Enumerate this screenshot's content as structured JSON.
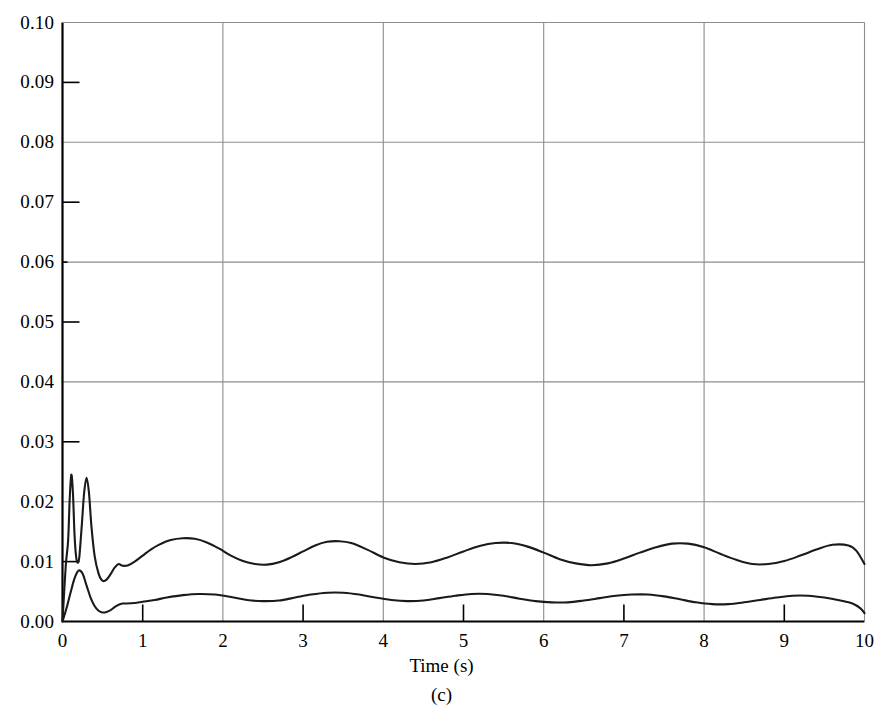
{
  "chart_data": {
    "type": "line",
    "title": "",
    "subfigure_label": "(c)",
    "xlabel": "Time (s)",
    "ylabel": "",
    "xlim": [
      0,
      10
    ],
    "ylim": [
      0,
      0.1
    ],
    "grid": true,
    "grid_x_values": [
      2,
      4,
      6,
      8
    ],
    "grid_y_values": [
      0.02,
      0.04,
      0.06,
      0.08,
      0.1
    ],
    "tick_only_x_values": [
      1,
      3,
      5,
      7,
      9
    ],
    "tick_only_y_values": [
      0.01,
      0.03,
      0.05,
      0.07,
      0.09
    ],
    "xticks": [
      0,
      1,
      2,
      3,
      4,
      5,
      6,
      7,
      8,
      9,
      10
    ],
    "xticklabels": [
      "0",
      "1",
      "2",
      "3",
      "4",
      "5",
      "6",
      "7",
      "8",
      "9",
      "10"
    ],
    "yticks": [
      0.0,
      0.01,
      0.02,
      0.03,
      0.04,
      0.05,
      0.06,
      0.07,
      0.08,
      0.09,
      0.1
    ],
    "yticklabels": [
      "0.00",
      "0.01",
      "0.02",
      "0.03",
      "0.04",
      "0.05",
      "0.06",
      "0.07",
      "0.08",
      "0.09",
      "0.10"
    ],
    "legend": null,
    "line_color": "#1a1a1a",
    "grid_color": "#8c8c8c",
    "axis_color": "#000000",
    "series": [
      {
        "name": "upper-curve",
        "x": [
          0.0,
          0.04,
          0.07,
          0.09,
          0.11,
          0.13,
          0.15,
          0.17,
          0.19,
          0.21,
          0.24,
          0.27,
          0.3,
          0.33,
          0.36,
          0.4,
          0.45,
          0.5,
          0.55,
          0.6,
          0.65,
          0.7,
          0.75,
          0.82,
          0.9,
          1.0,
          1.1,
          1.2,
          1.35,
          1.5,
          1.65,
          1.8,
          1.95,
          2.1,
          2.25,
          2.4,
          2.55,
          2.7,
          2.85,
          3.0,
          3.15,
          3.3,
          3.45,
          3.6,
          3.8,
          4.0,
          4.2,
          4.4,
          4.6,
          4.8,
          5.0,
          5.2,
          5.4,
          5.6,
          5.8,
          6.0,
          6.2,
          6.4,
          6.6,
          6.8,
          7.0,
          7.2,
          7.4,
          7.6,
          7.8,
          8.0,
          8.2,
          8.4,
          8.6,
          8.8,
          9.0,
          9.2,
          9.4,
          9.6,
          9.8,
          9.9,
          10.0
        ],
        "y": [
          0.0,
          0.0092,
          0.0135,
          0.0205,
          0.0245,
          0.0215,
          0.0145,
          0.0108,
          0.0098,
          0.0108,
          0.016,
          0.0215,
          0.024,
          0.0215,
          0.016,
          0.011,
          0.008,
          0.0068,
          0.007,
          0.0079,
          0.009,
          0.0096,
          0.0093,
          0.0094,
          0.01,
          0.011,
          0.012,
          0.0128,
          0.0136,
          0.0139,
          0.0138,
          0.0132,
          0.0122,
          0.011,
          0.0101,
          0.0096,
          0.0095,
          0.0099,
          0.0107,
          0.0117,
          0.0127,
          0.0133,
          0.0134,
          0.0131,
          0.012,
          0.0107,
          0.0099,
          0.0096,
          0.0099,
          0.0107,
          0.0117,
          0.0126,
          0.0131,
          0.0131,
          0.0125,
          0.0115,
          0.0104,
          0.0097,
          0.0094,
          0.0097,
          0.0105,
          0.0115,
          0.0124,
          0.013,
          0.013,
          0.0124,
          0.0113,
          0.0103,
          0.0096,
          0.0096,
          0.0101,
          0.011,
          0.012,
          0.0128,
          0.0127,
          0.0118,
          0.0096
        ]
      },
      {
        "name": "lower-curve",
        "x": [
          0.0,
          0.05,
          0.1,
          0.15,
          0.2,
          0.25,
          0.3,
          0.35,
          0.4,
          0.45,
          0.5,
          0.55,
          0.6,
          0.65,
          0.7,
          0.75,
          0.8,
          0.9,
          1.0,
          1.15,
          1.3,
          1.5,
          1.7,
          1.9,
          2.1,
          2.3,
          2.5,
          2.7,
          2.9,
          3.1,
          3.3,
          3.5,
          3.7,
          3.9,
          4.1,
          4.3,
          4.5,
          4.7,
          4.9,
          5.1,
          5.3,
          5.5,
          5.7,
          5.9,
          6.1,
          6.3,
          6.5,
          6.7,
          6.9,
          7.1,
          7.3,
          7.5,
          7.7,
          7.9,
          8.1,
          8.3,
          8.5,
          8.7,
          8.9,
          9.1,
          9.3,
          9.5,
          9.7,
          9.85,
          9.95,
          10.0
        ],
        "y": [
          0.0,
          0.0022,
          0.0048,
          0.0072,
          0.0085,
          0.008,
          0.006,
          0.004,
          0.0026,
          0.0018,
          0.0015,
          0.0016,
          0.0019,
          0.0024,
          0.0028,
          0.003,
          0.003,
          0.0031,
          0.0033,
          0.0036,
          0.004,
          0.0044,
          0.0046,
          0.0045,
          0.0041,
          0.0036,
          0.0034,
          0.0035,
          0.004,
          0.0045,
          0.0048,
          0.0048,
          0.0045,
          0.004,
          0.0036,
          0.0034,
          0.0035,
          0.0039,
          0.0043,
          0.0046,
          0.0046,
          0.0043,
          0.0038,
          0.0034,
          0.0032,
          0.0032,
          0.0035,
          0.0039,
          0.0043,
          0.0045,
          0.0045,
          0.0042,
          0.0037,
          0.0032,
          0.0029,
          0.0029,
          0.0032,
          0.0036,
          0.004,
          0.0043,
          0.0043,
          0.004,
          0.0035,
          0.003,
          0.0022,
          0.0014
        ]
      }
    ]
  }
}
